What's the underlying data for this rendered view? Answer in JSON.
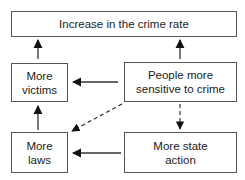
{
  "diagram": {
    "nodes": {
      "crime_rate": {
        "label": "Increase in the crime rate"
      },
      "victims": {
        "line1": "More",
        "line2": "victims"
      },
      "sensitive": {
        "line1": "People more",
        "line2": "sensitive to crime"
      },
      "laws": {
        "line1": "More",
        "line2": "laws"
      },
      "state_action": {
        "line1": "More state",
        "line2": "action"
      }
    },
    "edges": [
      {
        "from": "victims",
        "to": "crime_rate",
        "style": "solid"
      },
      {
        "from": "sensitive",
        "to": "crime_rate",
        "style": "solid"
      },
      {
        "from": "sensitive",
        "to": "victims",
        "style": "solid"
      },
      {
        "from": "sensitive",
        "to": "laws",
        "style": "dashed"
      },
      {
        "from": "sensitive",
        "to": "state_action",
        "style": "dashed"
      },
      {
        "from": "laws",
        "to": "victims",
        "style": "solid"
      },
      {
        "from": "state_action",
        "to": "laws",
        "style": "solid"
      }
    ],
    "colors": {
      "stroke": "#555555",
      "arrow": "#111111",
      "text": "#222222"
    }
  }
}
